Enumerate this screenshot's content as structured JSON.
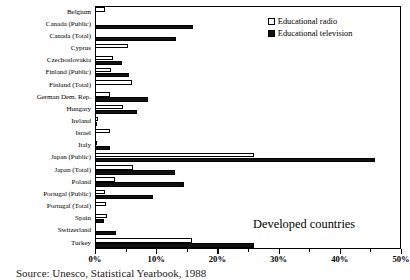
{
  "chart_data": {
    "type": "bar",
    "orientation": "horizontal",
    "title": "",
    "annotation": "Developed countries",
    "source_note": "Source: Unesco, Statistical Yearbook, 1988",
    "xlabel": "",
    "ylabel": "",
    "xlim": [
      0,
      50
    ],
    "xunit": "%",
    "grid": false,
    "legend_position": "top-right",
    "tick_labels": [
      "0%",
      "10%",
      "20%",
      "30%",
      "40%",
      "50%"
    ],
    "tick_values": [
      0,
      10,
      20,
      30,
      40,
      50
    ],
    "minor_tick_values": [
      5,
      15,
      25,
      35,
      45
    ],
    "categories": [
      "Belgium",
      "Canada (Public)",
      "Canada (Total)",
      "Cyprus",
      "Czechoslovakia",
      "Finland (Public)",
      "Finland (Total)",
      "German Dem. Rep.",
      "Hungary",
      "Ireland",
      "Israel",
      "Italy",
      "Japan (Public)",
      "Japan (Total)",
      "Poland",
      "Portugal (Public)",
      "Portugal (Total)",
      "Spain",
      "Switzerland",
      "Turkey"
    ],
    "series": [
      {
        "name": "Educational radio",
        "color": "#ffffff",
        "values": [
          1.6,
          0.0,
          0.0,
          5.4,
          3.0,
          2.6,
          6.0,
          2.4,
          4.6,
          0.5,
          2.4,
          0.3,
          26.0,
          6.2,
          3.2,
          1.6,
          1.8,
          1.9,
          0.0,
          15.8
        ]
      },
      {
        "name": "Educational television",
        "color": "#111111",
        "values": [
          0.0,
          16.0,
          13.3,
          0.0,
          4.4,
          5.6,
          0.0,
          8.6,
          6.8,
          0.4,
          0.0,
          2.5,
          45.8,
          13.0,
          14.6,
          9.4,
          0.0,
          1.4,
          3.5,
          26.0
        ]
      }
    ]
  },
  "legend": {
    "items": [
      {
        "label": "Educational radio",
        "swatch": "hollow-square"
      },
      {
        "label": "Educational television",
        "swatch": "filled-square"
      }
    ]
  }
}
